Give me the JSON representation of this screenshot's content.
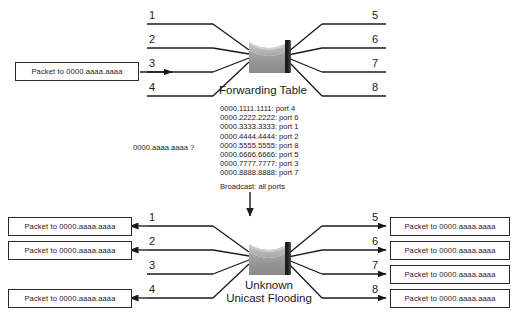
{
  "diagram": {
    "title_top": "Forwarding Table",
    "title_bottom_line1": "Unknown",
    "title_bottom_line2": "Unicast Flooding",
    "broadcast_label": "Broadcast: all ports",
    "query_label": "0000.aaaa.aaaa  ?",
    "packet_text": "Packet to 0000.aaaa.aaaa",
    "colors": {
      "line": "#1a1a1a",
      "switch_light": "#b9b9b9",
      "switch_mid": "#909090",
      "switch_dark": "#1c1c1c",
      "background": "#ffffff"
    },
    "forwarding_table": [
      {
        "mac": "0000.1111.1111",
        "port": "port 4",
        "text": "0000.1111.1111: port 4"
      },
      {
        "mac": "0000.2222.2222",
        "port": "port 6",
        "text": "0000.2222.2222: port 6"
      },
      {
        "mac": "0000.3333.3333",
        "port": "port 1",
        "text": "0000.3333.3333: port 1"
      },
      {
        "mac": "0000.4444.4444",
        "port": "port 2",
        "text": "0000.4444.4444: port 2"
      },
      {
        "mac": "0000.5555.5555",
        "port": "port 8",
        "text": "0000.5555.5555: port 8"
      },
      {
        "mac": "0000.6666.6666",
        "port": "port 5",
        "text": "0000.6666.6666: port 5"
      },
      {
        "mac": "0000.7777.7777",
        "port": "port 3",
        "text": "0000.7777.7777: port 3"
      },
      {
        "mac": "0000.8888.8888",
        "port": "port 7",
        "text": "0000.8888.8888: port 7"
      }
    ],
    "top": {
      "ports_left": [
        "1",
        "2",
        "3",
        "4"
      ],
      "ports_right": [
        "5",
        "6",
        "7",
        "8"
      ],
      "ingress_packet": "Packet to 0000.aaaa.aaaa"
    },
    "bottom": {
      "ports_left": [
        "1",
        "2",
        "3",
        "4"
      ],
      "ports_right": [
        "5",
        "6",
        "7",
        "8"
      ],
      "left_packets": [
        "Packet to 0000.aaaa.aaaa",
        "Packet to 0000.aaaa.aaaa",
        "Packet to 0000.aaaa.aaaa"
      ],
      "right_packets": [
        "Packet to 0000.aaaa.aaaa",
        "Packet to 0000.aaaa.aaaa",
        "Packet to 0000.aaaa.aaaa",
        "Packet to 0000.aaaa.aaaa"
      ]
    }
  }
}
